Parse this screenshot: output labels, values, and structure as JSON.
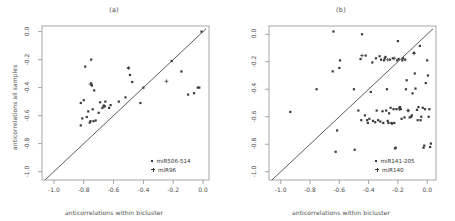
{
  "figure": {
    "background": "#ffffff",
    "marker_color": "#3a3a3a",
    "axis_color": "#808080",
    "line_color": "#333333"
  },
  "chart_data": [
    {
      "type": "scatter",
      "title": "(a)",
      "xlabel": "anticorrelations within bicluster",
      "ylabel": "anticorrelations all samples",
      "xlim": [
        -1.08,
        0.04
      ],
      "ylim": [
        -1.06,
        0.04
      ],
      "xticks": [
        -1.0,
        -0.8,
        -0.6,
        -0.4,
        -0.2,
        0.0
      ],
      "xticklabels": [
        "-1.0",
        "-0.8",
        "-0.6",
        "-0.4",
        "-0.2",
        "0.0"
      ],
      "yticks": [
        0.0,
        -0.2,
        -0.4,
        -0.6,
        -0.8,
        -1.0
      ],
      "yticklabels": [
        "0.0",
        "-0.2",
        "-0.4",
        "-0.6",
        "-0.8",
        "-1.0"
      ],
      "grid": false,
      "legend_position": "lower right",
      "reference_line": {
        "type": "identity",
        "from": [
          -1.06,
          -1.06
        ],
        "to": [
          0.02,
          0.02
        ]
      },
      "series": [
        {
          "name": "miR506-514",
          "marker": "square",
          "points": [
            [
              -0.82,
              -0.67
            ],
            [
              -0.81,
              -0.62
            ],
            [
              -0.82,
              -0.51
            ],
            [
              -0.8,
              -0.49
            ],
            [
              -0.79,
              -0.25
            ],
            [
              -0.78,
              -0.61
            ],
            [
              -0.77,
              -0.57
            ],
            [
              -0.76,
              -0.65
            ],
            [
              -0.755,
              -0.64
            ],
            [
              -0.75,
              -0.2
            ],
            [
              -0.75,
              -0.37
            ],
            [
              -0.745,
              -0.385
            ],
            [
              -0.74,
              -0.555
            ],
            [
              -0.735,
              -0.64
            ],
            [
              -0.73,
              -0.42
            ],
            [
              -0.72,
              -0.635
            ],
            [
              -0.7,
              -0.58
            ],
            [
              -0.69,
              -0.505
            ],
            [
              -0.675,
              -0.545
            ],
            [
              -0.665,
              -0.53
            ],
            [
              -0.66,
              -0.535
            ],
            [
              -0.655,
              -0.5
            ],
            [
              -0.63,
              -0.545
            ],
            [
              -0.62,
              -0.525
            ],
            [
              -0.565,
              -0.5
            ],
            [
              -0.52,
              -0.47
            ],
            [
              -0.5,
              -0.26
            ],
            [
              -0.49,
              -0.31
            ],
            [
              -0.475,
              -0.36
            ],
            [
              -0.42,
              -0.51
            ],
            [
              -0.4,
              -0.4
            ],
            [
              -0.21,
              -0.21
            ],
            [
              -0.145,
              -0.285
            ],
            [
              -0.1,
              -0.45
            ],
            [
              -0.06,
              -0.44
            ],
            [
              -0.035,
              -0.4
            ],
            [
              -0.025,
              -0.4
            ],
            [
              -0.01,
              0.0
            ]
          ]
        },
        {
          "name": "miR96",
          "marker": "plus",
          "points": [
            [
              -0.755,
              -0.375
            ],
            [
              -0.665,
              -0.53
            ],
            [
              -0.5,
              -0.26
            ],
            [
              -0.245,
              -0.355
            ]
          ]
        }
      ]
    },
    {
      "type": "scatter",
      "title": "(b)",
      "xlabel": "anticorrelations within bicluster",
      "ylabel": "anticorrelations all samples",
      "xlim": [
        -1.08,
        0.06
      ],
      "ylim": [
        -1.06,
        0.06
      ],
      "xticks": [
        -1.0,
        -0.8,
        -0.6,
        -0.4,
        -0.2,
        0.0
      ],
      "xticklabels": [
        "-1.0",
        "-0.8",
        "-0.6",
        "-0.4",
        "-0.2",
        "0.0"
      ],
      "yticks": [
        0.0,
        -0.2,
        -0.4,
        -0.6,
        -0.8,
        -1.0
      ],
      "yticklabels": [
        "0.0",
        "-0.2",
        "-0.4",
        "-0.6",
        "-0.8",
        "-1.0"
      ],
      "grid": false,
      "legend_position": "lower right",
      "reference_line": {
        "type": "identity",
        "from": [
          -1.06,
          -1.06
        ],
        "to": [
          0.04,
          0.04
        ]
      },
      "series": [
        {
          "name": "miR141-205",
          "marker": "square",
          "points": [
            [
              -0.935,
              -0.565
            ],
            [
              -0.755,
              -0.4
            ],
            [
              -0.645,
              -0.27
            ],
            [
              -0.64,
              0.02
            ],
            [
              -0.625,
              -0.855
            ],
            [
              -0.615,
              -0.7
            ],
            [
              -0.6,
              -0.245
            ],
            [
              -0.595,
              -0.19
            ],
            [
              -0.5,
              -0.4
            ],
            [
              -0.495,
              -0.84
            ],
            [
              -0.47,
              -0.555
            ],
            [
              -0.455,
              -0.18
            ],
            [
              -0.45,
              -0.625
            ],
            [
              -0.445,
              0.0
            ],
            [
              -0.425,
              -0.59
            ],
            [
              -0.42,
              -0.155
            ],
            [
              -0.41,
              -0.625
            ],
            [
              -0.405,
              -0.645
            ],
            [
              -0.395,
              -0.615
            ],
            [
              -0.385,
              -0.42
            ],
            [
              -0.375,
              -0.205
            ],
            [
              -0.37,
              -0.63
            ],
            [
              -0.355,
              -0.64
            ],
            [
              -0.35,
              -0.175
            ],
            [
              -0.345,
              -0.555
            ],
            [
              -0.335,
              -0.625
            ],
            [
              -0.325,
              -0.16
            ],
            [
              -0.32,
              -0.635
            ],
            [
              -0.315,
              -0.185
            ],
            [
              -0.305,
              -0.56
            ],
            [
              -0.3,
              -0.645
            ],
            [
              -0.295,
              -0.19
            ],
            [
              -0.29,
              -0.175
            ],
            [
              -0.285,
              -0.165
            ],
            [
              -0.28,
              -0.555
            ],
            [
              -0.275,
              -0.4
            ],
            [
              -0.27,
              -0.63
            ],
            [
              -0.265,
              -0.645
            ],
            [
              -0.26,
              -0.575
            ],
            [
              -0.255,
              -0.185
            ],
            [
              -0.25,
              -0.535
            ],
            [
              -0.245,
              -0.645
            ],
            [
              -0.24,
              -0.65
            ],
            [
              -0.235,
              -0.175
            ],
            [
              -0.23,
              -0.545
            ],
            [
              -0.225,
              -0.645
            ],
            [
              -0.22,
              -0.83
            ],
            [
              -0.215,
              -0.825
            ],
            [
              -0.21,
              -0.545
            ],
            [
              -0.205,
              -0.19
            ],
            [
              -0.2,
              -0.05
            ],
            [
              -0.195,
              -0.18
            ],
            [
              -0.19,
              -0.535
            ],
            [
              -0.185,
              -0.53
            ],
            [
              -0.18,
              -0.545
            ],
            [
              -0.175,
              -0.615
            ],
            [
              -0.17,
              -0.19
            ],
            [
              -0.165,
              -0.175
            ],
            [
              -0.155,
              -0.605
            ],
            [
              -0.15,
              -0.185
            ],
            [
              -0.145,
              -0.4
            ],
            [
              -0.14,
              -0.335
            ],
            [
              -0.13,
              -0.555
            ],
            [
              -0.12,
              -0.605
            ],
            [
              -0.11,
              -0.6
            ],
            [
              -0.105,
              -0.59
            ],
            [
              -0.1,
              -0.43
            ],
            [
              -0.09,
              -0.135
            ],
            [
              -0.085,
              -0.285
            ],
            [
              -0.08,
              -0.395
            ],
            [
              -0.07,
              -0.55
            ],
            [
              -0.065,
              -0.625
            ],
            [
              -0.06,
              -0.53
            ],
            [
              -0.05,
              -0.085
            ],
            [
              -0.045,
              -0.625
            ],
            [
              -0.04,
              -0.6
            ],
            [
              -0.03,
              -0.535
            ],
            [
              -0.025,
              -0.825
            ],
            [
              -0.02,
              -0.81
            ],
            [
              -0.015,
              -0.545
            ],
            [
              -0.01,
              -0.355
            ],
            [
              0.0,
              -0.19
            ],
            [
              0.005,
              -0.3
            ],
            [
              0.01,
              -0.6
            ],
            [
              0.015,
              -0.545
            ],
            [
              0.02,
              -0.82
            ],
            [
              0.025,
              -0.795
            ]
          ]
        },
        {
          "name": "miR140",
          "marker": "plus",
          "points": [
            [
              -0.445,
              -0.155
            ],
            [
              -0.27,
              -0.185
            ],
            [
              -0.225,
              -0.175
            ],
            [
              -0.19,
              -0.545
            ],
            [
              -0.13,
              -0.555
            ],
            [
              -0.09,
              -0.14
            ]
          ]
        }
      ]
    }
  ]
}
